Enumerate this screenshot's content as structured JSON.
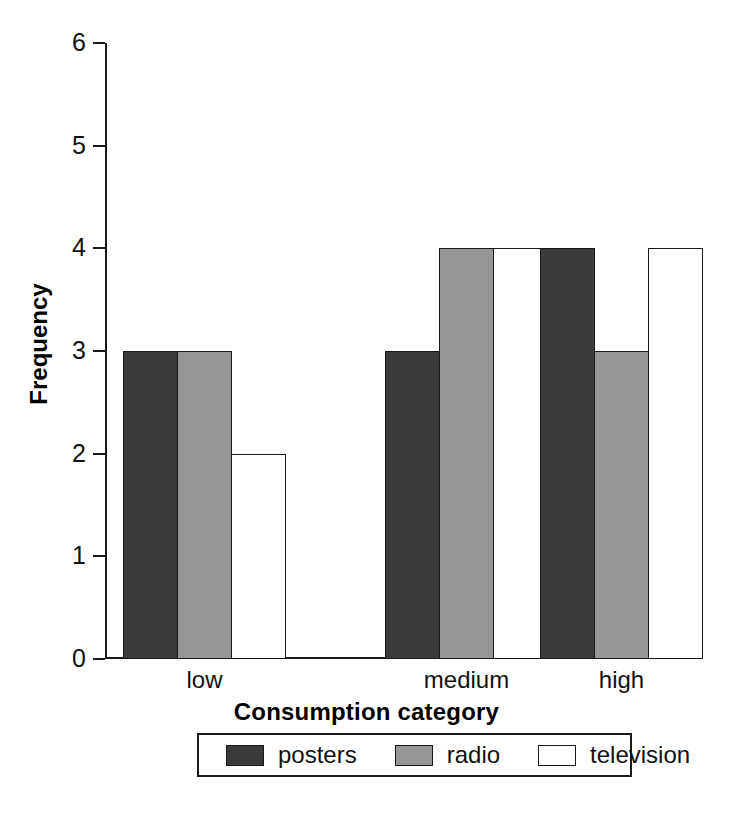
{
  "chart_data": {
    "type": "bar",
    "title": "",
    "xlabel": "Consumption category",
    "ylabel": "Frequency",
    "categories": [
      "low",
      "medium",
      "high"
    ],
    "series": [
      {
        "name": "posters",
        "values": [
          3,
          3,
          4
        ],
        "color": "#3a3a3a"
      },
      {
        "name": "radio",
        "values": [
          3,
          4,
          3
        ],
        "color": "#969696"
      },
      {
        "name": "television",
        "values": [
          2,
          4,
          4
        ],
        "color": "#ffffff"
      }
    ],
    "ylim": [
      0,
      6
    ],
    "yticks": [
      0,
      1,
      2,
      3,
      4,
      5,
      6
    ],
    "ytick_labels": [
      "0",
      "1",
      "2",
      "3",
      "4",
      "5",
      "6"
    ],
    "grid": false,
    "legend_position": "bottom",
    "grouping": "grouped"
  },
  "axes": {
    "y_title": "Frequency",
    "x_title": "Consumption category"
  },
  "legend": {
    "entries": [
      {
        "label": "posters",
        "color": "#3a3a3a"
      },
      {
        "label": "radio",
        "color": "#969696"
      },
      {
        "label": "television",
        "color": "#ffffff"
      }
    ]
  }
}
